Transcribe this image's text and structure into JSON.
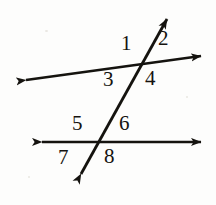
{
  "figure": {
    "background_color": "#fdfdfc",
    "stroke_color": "#15130f",
    "width": 216,
    "height": 205
  },
  "lines": [
    {
      "id": "upper-line",
      "name": "upper-transversal-cut-line",
      "x1": 26,
      "y1": 80,
      "x2": 201,
      "y2": 56,
      "arrow_start": true,
      "arrow_end": true
    },
    {
      "id": "lower-line",
      "name": "lower-transversal-cut-line",
      "x1": 42,
      "y1": 142,
      "x2": 201,
      "y2": 142,
      "arrow_start": true,
      "arrow_end": true
    },
    {
      "id": "transversal",
      "name": "transversal-line",
      "x1": 81,
      "y1": 174,
      "x2": 167,
      "y2": 19,
      "arrow_start": true,
      "arrow_end": true
    }
  ],
  "intersections": [
    {
      "name": "upper-intersection",
      "x": 140,
      "y": 63
    },
    {
      "name": "lower-intersection",
      "x": 97,
      "y": 142
    }
  ],
  "angle_labels": [
    {
      "id": "1",
      "text": "1",
      "x": 121,
      "y": 33,
      "at": "upper-intersection",
      "position": "upper-left"
    },
    {
      "id": "2",
      "text": "2",
      "x": 158,
      "y": 28,
      "at": "upper-intersection",
      "position": "upper-right"
    },
    {
      "id": "3",
      "text": "3",
      "x": 103,
      "y": 69,
      "at": "upper-intersection",
      "position": "lower-left"
    },
    {
      "id": "4",
      "text": "4",
      "x": 145,
      "y": 68,
      "at": "upper-intersection",
      "position": "lower-right"
    },
    {
      "id": "5",
      "text": "5",
      "x": 72,
      "y": 113,
      "at": "lower-intersection",
      "position": "upper-left"
    },
    {
      "id": "6",
      "text": "6",
      "x": 119,
      "y": 113,
      "at": "lower-intersection",
      "position": "upper-right"
    },
    {
      "id": "7",
      "text": "7",
      "x": 58,
      "y": 147,
      "at": "lower-intersection",
      "position": "lower-left"
    },
    {
      "id": "8",
      "text": "8",
      "x": 104,
      "y": 146,
      "at": "lower-intersection",
      "position": "lower-right"
    }
  ]
}
